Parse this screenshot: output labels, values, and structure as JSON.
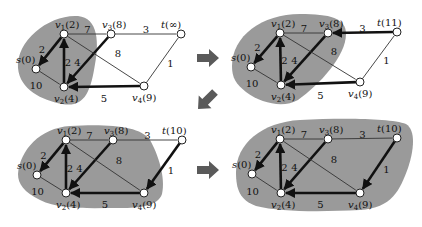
{
  "panels": [
    {
      "id": "step1",
      "node_labels": {
        "s": "s(0)",
        "v1": "v1(2)",
        "v2": "v2(4)",
        "v3": "v3(8)",
        "v4": "v4(9)",
        "t": "t(∞)"
      },
      "nodes": {
        "s": [
          36,
          69
        ],
        "v1": [
          64,
          34
        ],
        "v2": [
          64,
          87
        ],
        "v3": [
          111,
          34
        ],
        "v4": [
          144,
          86
        ],
        "t": [
          181,
          34
        ]
      },
      "region": "M18,68 C16,40 50,14 78,16 C98,18 100,42 94,70 C90,92 84,108 62,104 C42,100 20,90 18,68 Z",
      "edges": [
        {
          "from": "v1",
          "to": "s",
          "w": "2",
          "bold": true
        },
        {
          "from": "v2",
          "to": "v1",
          "w": "2",
          "bold": true
        },
        {
          "from": "s",
          "to": "v2",
          "w": "10",
          "bold": false
        },
        {
          "from": "v1",
          "to": "v3",
          "w": "7",
          "bold": false
        },
        {
          "from": "v3",
          "to": "v2",
          "w": "4",
          "bold": true
        },
        {
          "from": "v1",
          "to": "v4",
          "w": "8",
          "bold": false
        },
        {
          "from": "v4",
          "to": "v2",
          "w": "5",
          "bold": true
        },
        {
          "from": "v3",
          "to": "t",
          "w": "3",
          "bold": false
        },
        {
          "from": "v4",
          "to": "t",
          "w": "1",
          "bold": false
        }
      ]
    },
    {
      "id": "step2",
      "node_labels": {
        "s": "s(0)",
        "v1": "v1(2)",
        "v2": "v2(4)",
        "v3": "v3(8)",
        "v4": "v4(9)",
        "t": "t(11)"
      },
      "nodes": {
        "s": [
          251,
          67
        ],
        "v1": [
          280,
          33
        ],
        "v2": [
          281,
          85
        ],
        "v3": [
          328,
          33
        ],
        "v4": [
          360,
          82
        ],
        "t": [
          397,
          32
        ]
      },
      "region": "M232,66 C232,36 262,14 300,14 C330,14 346,18 346,34 C346,56 320,84 298,100 C284,108 262,104 246,92 C236,84 232,78 232,66 Z",
      "edges": [
        {
          "from": "v1",
          "to": "s",
          "w": "2",
          "bold": true
        },
        {
          "from": "v2",
          "to": "v1",
          "w": "2",
          "bold": true
        },
        {
          "from": "s",
          "to": "v2",
          "w": "10",
          "bold": false
        },
        {
          "from": "v1",
          "to": "v3",
          "w": "7",
          "bold": false
        },
        {
          "from": "v3",
          "to": "v2",
          "w": "4",
          "bold": true
        },
        {
          "from": "v1",
          "to": "v4",
          "w": "8",
          "bold": false
        },
        {
          "from": "v4",
          "to": "v2",
          "w": "5",
          "bold": true
        },
        {
          "from": "t",
          "to": "v3",
          "w": "3",
          "bold": true
        },
        {
          "from": "v4",
          "to": "t",
          "w": "1",
          "bold": false
        }
      ]
    },
    {
      "id": "step3",
      "node_labels": {
        "s": "s(0)",
        "v1": "v1(2)",
        "v2": "v2(4)",
        "v3": "v3(8)",
        "v4": "v4(9)",
        "t": "t(10)"
      },
      "nodes": {
        "s": [
          37,
          175
        ],
        "v1": [
          66,
          140
        ],
        "v2": [
          66,
          193
        ],
        "v3": [
          113,
          140
        ],
        "v4": [
          144,
          193
        ],
        "t": [
          182,
          140
        ]
      },
      "region": "M18,174 C20,150 40,128 70,126 C110,124 140,126 150,140 C158,154 166,178 162,194 C158,206 140,208 120,208 C90,208 60,210 40,200 C24,192 18,184 18,174 Z",
      "edges": [
        {
          "from": "v1",
          "to": "s",
          "w": "2",
          "bold": true
        },
        {
          "from": "v2",
          "to": "v1",
          "w": "2",
          "bold": true
        },
        {
          "from": "s",
          "to": "v2",
          "w": "10",
          "bold": false
        },
        {
          "from": "v1",
          "to": "v3",
          "w": "7",
          "bold": false
        },
        {
          "from": "v3",
          "to": "v2",
          "w": "4",
          "bold": true
        },
        {
          "from": "v1",
          "to": "v4",
          "w": "8",
          "bold": false
        },
        {
          "from": "v4",
          "to": "v2",
          "w": "5",
          "bold": true
        },
        {
          "from": "v3",
          "to": "t",
          "w": "3",
          "bold": false
        },
        {
          "from": "t",
          "to": "v4",
          "w": "1",
          "bold": true
        }
      ]
    },
    {
      "id": "step4",
      "node_labels": {
        "s": "s(0)",
        "v1": "v1(2)",
        "v2": "v2(4)",
        "v3": "v3(8)",
        "v4": "v4(9)",
        "t": "t(10)"
      },
      "nodes": {
        "s": [
          252,
          174
        ],
        "v1": [
          280,
          139
        ],
        "v2": [
          281,
          193
        ],
        "v3": [
          328,
          139
        ],
        "v4": [
          360,
          193
        ],
        "t": [
          397,
          138
        ]
      },
      "region": "M236,172 C236,144 262,122 300,120 C340,118 390,118 406,124 C416,130 414,150 408,168 C400,190 392,208 360,210 C320,212 280,212 256,206 C240,200 236,190 236,172 Z",
      "edges": [
        {
          "from": "v1",
          "to": "s",
          "w": "2",
          "bold": true
        },
        {
          "from": "v2",
          "to": "v1",
          "w": "2",
          "bold": true
        },
        {
          "from": "s",
          "to": "v2",
          "w": "10",
          "bold": false
        },
        {
          "from": "v1",
          "to": "v3",
          "w": "7",
          "bold": false
        },
        {
          "from": "v3",
          "to": "v2",
          "w": "4",
          "bold": true
        },
        {
          "from": "v1",
          "to": "v4",
          "w": "8",
          "bold": false
        },
        {
          "from": "v4",
          "to": "v2",
          "w": "5",
          "bold": true
        },
        {
          "from": "v3",
          "to": "t",
          "w": "3",
          "bold": false
        },
        {
          "from": "t",
          "to": "v4",
          "w": "1",
          "bold": true
        }
      ]
    }
  ],
  "transition_arrows": [
    {
      "name": "arrow-step1-to-step2",
      "direction": "right",
      "x": 197,
      "y": 58
    },
    {
      "name": "arrow-step2-to-step3",
      "direction": "down-left",
      "x": 215,
      "y": 92
    },
    {
      "name": "arrow-step3-to-step4",
      "direction": "right",
      "x": 197,
      "y": 170
    }
  ],
  "colors": {
    "region": "#9a9a9a",
    "arrow": "#5a5a5a",
    "node_fill": "#ffffff",
    "edge": "#333333"
  }
}
